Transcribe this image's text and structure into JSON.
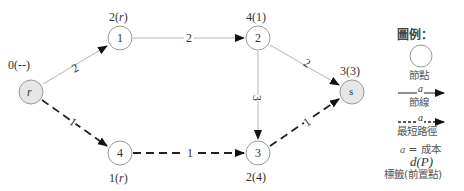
{
  "diagram": {
    "nodes": [
      {
        "id": "r",
        "label": "r",
        "italic": true,
        "shaded": true,
        "x": 31,
        "y": 92,
        "tag": "0(--)"
      },
      {
        "id": "1",
        "label": "1",
        "italic": false,
        "shaded": false,
        "x": 120,
        "y": 38,
        "tag": "2(r)"
      },
      {
        "id": "2",
        "label": "2",
        "italic": false,
        "shaded": false,
        "x": 258,
        "y": 38,
        "tag": "4(1)"
      },
      {
        "id": "4",
        "label": "4",
        "italic": false,
        "shaded": false,
        "x": 120,
        "y": 153,
        "tag": "1(r)"
      },
      {
        "id": "3",
        "label": "3",
        "italic": false,
        "shaded": false,
        "x": 258,
        "y": 153,
        "tag": "2(4)"
      },
      {
        "id": "s",
        "label": "s",
        "italic": false,
        "shaded": true,
        "x": 352,
        "y": 92,
        "tag": "3(3)"
      }
    ],
    "edges": [
      {
        "from": "r",
        "to": "1",
        "cost": "2",
        "shortest": false
      },
      {
        "from": "1",
        "to": "2",
        "cost": "2",
        "shortest": false
      },
      {
        "from": "2",
        "to": "s",
        "cost": "2",
        "shortest": false
      },
      {
        "from": "2",
        "to": "3",
        "cost": "3",
        "shortest": false
      },
      {
        "from": "r",
        "to": "4",
        "cost": "1",
        "shortest": true
      },
      {
        "from": "4",
        "to": "3",
        "cost": "1",
        "shortest": true
      },
      {
        "from": "3",
        "to": "s",
        "cost": "1",
        "shortest": true
      }
    ]
  },
  "labels": {
    "tag_r": "0(--)",
    "tag_1": "2(",
    "tag_1_var": "r",
    "tag_1_end": ")",
    "tag_2": "4(1)",
    "tag_4": "1(",
    "tag_4_var": "r",
    "tag_4_end": ")",
    "tag_3": "2(4)",
    "tag_s": "3(3)",
    "node_r": "r",
    "node_1": "1",
    "node_2": "2",
    "node_4": "4",
    "node_3": "3",
    "node_s": "s",
    "cost_r1": "2",
    "cost_12": "2",
    "cost_2s": "2",
    "cost_23": "3",
    "cost_r4": "1",
    "cost_43": "1",
    "cost_3s": "1"
  },
  "legend": {
    "title": "圖例：",
    "node_label": "節點",
    "edge_symbol": "a",
    "edge_label": "節線",
    "path_symbol": "a",
    "path_label": "最短路徑",
    "cost_var": "a",
    "cost_text": " = 成本",
    "tag_symbol": "d(P)",
    "tag_label": "標籤(前置點)"
  },
  "colors": {
    "edge_normal": "#b0b0b0",
    "edge_shortest": "#222222",
    "node_stroke": "#9a9a9a",
    "node_shaded_fill": "#e6e6e6",
    "node_fill": "#ffffff"
  }
}
